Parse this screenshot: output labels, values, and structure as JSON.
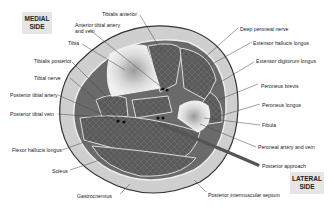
{
  "side_labels": {
    "medial": "MEDIAL SIDE",
    "lateral": "LATERAL SIDE"
  },
  "labels": {
    "tibialis_anterior": "Tibialis anterior",
    "anterior_tibial_artery": "Anterior tibial artery and vein",
    "tibia": "Tibia",
    "tibialis_posterior": "Tibialis posterior",
    "tibial_nerve": "Tibial nerve",
    "posterior_tibial_artery": "Posterior tibial artery",
    "posterior_tibial_vein": "Posterior tibial vein",
    "flexor_hallucis_longus": "Flexor hallucis longus",
    "soleus": "Soleus",
    "gastrocnemius": "Gastrocnemius",
    "deep_peroneal_nerve": "Deep peroneal nerve",
    "extensor_hallucis_longus": "Extensor hallucis longus",
    "extensor_digitorum_longus": "Extensor digitorum longus",
    "peroneus_brevis": "Peroneus brevis",
    "peroneus_longus": "Peroneus longus",
    "fibula": "Fibula",
    "peroneal_artery": "Peroneal artery and vein",
    "posterior_approach": "Posterior approach",
    "posterior_intermuscular_septum": "Posterior intermuscular septum"
  }
}
